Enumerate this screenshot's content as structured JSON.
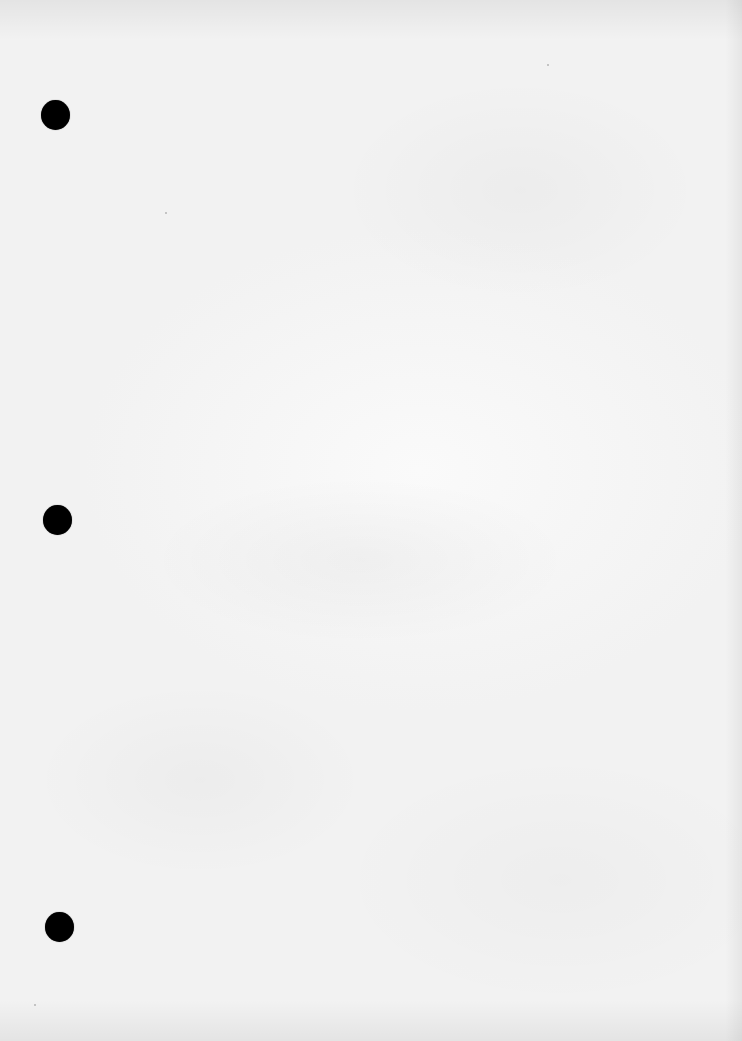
{
  "document": {
    "type": "blank-three-hole-punched-sheet",
    "text_content": "",
    "paper_color": "#f4f4f4",
    "punch_holes": [
      {
        "position": "top",
        "center_x": 55,
        "center_y": 115,
        "diameter": 29,
        "color": "#000000"
      },
      {
        "position": "middle",
        "center_x": 57,
        "center_y": 520,
        "diameter": 29,
        "color": "#000000"
      },
      {
        "position": "bottom",
        "center_x": 59,
        "center_y": 927,
        "diameter": 29,
        "color": "#000000"
      }
    ]
  }
}
